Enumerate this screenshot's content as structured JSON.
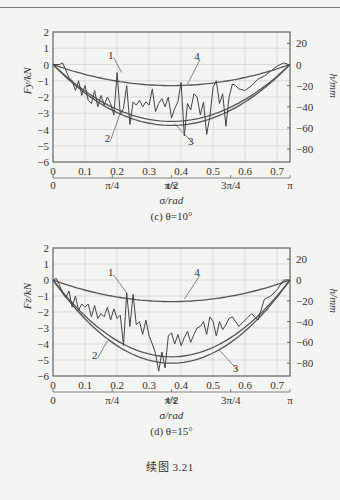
{
  "figure_caption": "续图 3.21",
  "chart_data": [
    {
      "type": "line",
      "subtitle": "(c) θ=10°",
      "xlabel": "t/s",
      "ylabel_left": "Fy/kN",
      "ylabel_right": "h/mm",
      "secondary_xlabel": "σ/rad",
      "xlim": [
        0,
        0.74
      ],
      "ylim_left": [
        -6,
        2
      ],
      "ylim_right": [
        -100,
        30
      ],
      "xticks": [
        "0",
        "0.1",
        "0.2",
        "0.3",
        "0.4",
        "0.5",
        "0.6",
        "0.7"
      ],
      "yticks_left": [
        "2",
        "1",
        "0",
        "−1",
        "−2",
        "−3",
        "−4",
        "−5",
        "−6"
      ],
      "yticks_right": [
        "20",
        "0",
        "−20",
        "−40",
        "−60",
        "−80"
      ],
      "secondary_xticks": [
        "0",
        "π/4",
        "π/2",
        "3π/4",
        "π"
      ],
      "grid": true,
      "series": [
        {
          "name": "1",
          "desc": "measured force (oscillating)",
          "x": [
            0,
            0.02,
            0.03,
            0.05,
            0.06,
            0.07,
            0.08,
            0.09,
            0.1,
            0.11,
            0.12,
            0.13,
            0.14,
            0.15,
            0.16,
            0.17,
            0.18,
            0.19,
            0.2,
            0.21,
            0.22,
            0.23,
            0.24,
            0.25,
            0.26,
            0.27,
            0.28,
            0.29,
            0.3,
            0.31,
            0.32,
            0.33,
            0.34,
            0.35,
            0.36,
            0.37,
            0.38,
            0.39,
            0.4,
            0.41,
            0.42,
            0.43,
            0.44,
            0.45,
            0.46,
            0.47,
            0.48,
            0.49,
            0.5,
            0.51,
            0.52,
            0.53,
            0.54,
            0.55,
            0.56,
            0.57,
            0.58,
            0.6,
            0.62,
            0.64,
            0.66,
            0.68,
            0.7,
            0.72,
            0.735
          ],
          "values": [
            0,
            0,
            0.1,
            -0.8,
            -1.0,
            -1.6,
            -1.0,
            -1.9,
            -1.3,
            -2.2,
            -2.4,
            -1.6,
            -2.6,
            -1.9,
            -2.5,
            -2.0,
            -2.4,
            -3.1,
            -0.5,
            -3.1,
            -2.7,
            -1.3,
            -3.7,
            -2.3,
            -2.5,
            -2.2,
            -2.6,
            -2.3,
            -2.5,
            -1.5,
            -2.9,
            -2.4,
            -2.1,
            -2.6,
            -2.0,
            -3.3,
            -2.7,
            -2.3,
            -1.1,
            -4.4,
            -2.4,
            -2.8,
            -1.8,
            -2.0,
            -3.1,
            -2.3,
            -4.3,
            -3.2,
            -1.4,
            -1.0,
            -2.4,
            -1.8,
            -3.8,
            -2.0,
            -1.2,
            -1.3,
            -1.5,
            -1.6,
            -1.3,
            -0.9,
            -0.7,
            -0.4,
            -0.1,
            0.1,
            0
          ]
        },
        {
          "name": "2",
          "desc": "curve 2",
          "peak": -3.5
        },
        {
          "name": "3",
          "desc": "curve 3",
          "peak": -3.75
        },
        {
          "name": "4",
          "desc": "curve 4 (h, right axis)",
          "peak": -1.3
        }
      ]
    },
    {
      "type": "line",
      "subtitle": "(d) θ=15°",
      "xlabel": "t/s",
      "ylabel_left": "Fz/kN",
      "ylabel_right": "h/mm",
      "secondary_xlabel": "σ/rad",
      "xlim": [
        0,
        0.74
      ],
      "ylim_left": [
        -6,
        2
      ],
      "ylim_right": [
        -100,
        30
      ],
      "xticks": [
        "0",
        "0.1",
        "0.2",
        "0.3",
        "0.4",
        "0.5",
        "0.6",
        "0.7"
      ],
      "yticks_left": [
        "2",
        "1",
        "0",
        "−1",
        "−2",
        "−3",
        "−4",
        "−5",
        "−6"
      ],
      "yticks_right": [
        "20",
        "0",
        "−20",
        "−40",
        "−60",
        "−80"
      ],
      "secondary_xticks": [
        "0",
        "π/4",
        "π/2",
        "3π/4",
        "π"
      ],
      "grid": true,
      "series": [
        {
          "name": "1",
          "desc": "measured force (oscillating)",
          "x": [
            0,
            0.01,
            0.02,
            0.03,
            0.04,
            0.05,
            0.06,
            0.07,
            0.08,
            0.09,
            0.1,
            0.11,
            0.12,
            0.13,
            0.14,
            0.15,
            0.16,
            0.17,
            0.18,
            0.19,
            0.2,
            0.21,
            0.22,
            0.23,
            0.24,
            0.25,
            0.26,
            0.27,
            0.28,
            0.29,
            0.3,
            0.31,
            0.32,
            0.33,
            0.34,
            0.35,
            0.36,
            0.37,
            0.38,
            0.39,
            0.4,
            0.41,
            0.42,
            0.43,
            0.44,
            0.45,
            0.46,
            0.47,
            0.48,
            0.49,
            0.5,
            0.51,
            0.52,
            0.53,
            0.54,
            0.55,
            0.56,
            0.58,
            0.6,
            0.62,
            0.64,
            0.66,
            0.68,
            0.7,
            0.72,
            0.735
          ],
          "values": [
            0,
            0.1,
            -0.3,
            -0.8,
            -1.1,
            -0.7,
            -1.7,
            -1.0,
            -1.9,
            -1.5,
            -1.7,
            -1.5,
            -2.3,
            -1.6,
            -2.4,
            -2.1,
            -2.3,
            -1.7,
            -2.5,
            -1.8,
            -2.4,
            -2.2,
            -4.1,
            -0.8,
            -2.9,
            -0.9,
            -2.8,
            -2.6,
            -3.4,
            -2.5,
            -3.5,
            -4.0,
            -4.6,
            -5.7,
            -4.5,
            -5.5,
            -3.5,
            -3.3,
            -4.0,
            -3.4,
            -4.1,
            -3.6,
            -3.2,
            -3.9,
            -3.4,
            -3.0,
            -2.9,
            -2.6,
            -3.4,
            -2.3,
            -2.6,
            -3.5,
            -2.6,
            -3.1,
            -2.8,
            -2.4,
            -2.3,
            -2.9,
            -2.5,
            -2.1,
            -2.5,
            -1.2,
            -1.0,
            -0.6,
            0,
            0
          ]
        },
        {
          "name": "2",
          "desc": "curve 2",
          "peak": -4.8
        },
        {
          "name": "3",
          "desc": "curve 3",
          "peak": -5.2
        },
        {
          "name": "4",
          "desc": "curve 4 (h, right axis)",
          "peak": -1.35
        }
      ]
    }
  ]
}
